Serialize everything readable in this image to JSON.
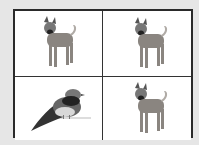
{
  "grid": {
    "rows": 2,
    "cols": 2,
    "cells": [
      {
        "position": "top-left",
        "subject": "dog"
      },
      {
        "position": "top-right",
        "subject": "dog"
      },
      {
        "position": "bottom-left",
        "subject": "bird"
      },
      {
        "position": "bottom-right",
        "subject": "dog"
      }
    ]
  },
  "colors": {
    "background": "#e6e6e6",
    "border": "#2a2a2a",
    "cell": "#ffffff"
  }
}
